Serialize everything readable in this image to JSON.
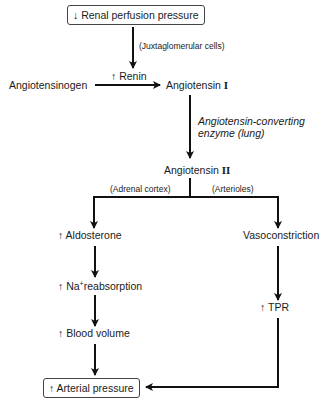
{
  "diagram": {
    "type": "flowchart",
    "nodes": {
      "renal_perfusion": {
        "arrow": "↓",
        "label": "Renal perfusion pressure"
      },
      "juxtaglomerular": {
        "label": "(Juxtaglomerular cells)"
      },
      "renin": {
        "arrow": "↑",
        "label": "Renin"
      },
      "angiotensinogen": {
        "label": "Angiotensinogen"
      },
      "angiotensin_1": {
        "label": "Angiotensin",
        "numeral": "I"
      },
      "ace_line1": {
        "label": "Angiotensin-converting"
      },
      "ace_line2": {
        "label": "enzyme (lung)"
      },
      "angiotensin_2": {
        "label": "Angiotensin",
        "numeral": "II"
      },
      "adrenal_cortex": {
        "label": "(Adrenal cortex)"
      },
      "arterioles": {
        "label": "(Arterioles)"
      },
      "aldosterone": {
        "arrow": "↑",
        "label": "Aldosterone"
      },
      "vasoconstriction": {
        "label": "Vasoconstriction"
      },
      "na_reabsorption": {
        "arrow": "↑",
        "prefix": "Na",
        "sup": "+",
        "label": "reabsorption"
      },
      "tpr": {
        "arrow": "↑",
        "label": "TPR"
      },
      "blood_volume": {
        "arrow": "↑",
        "label": "Blood volume"
      },
      "arterial_pressure": {
        "arrow": "↑",
        "label": "Arterial pressure"
      }
    },
    "edges": [
      [
        "renal_perfusion",
        "angiotensin_1"
      ],
      [
        "angiotensinogen",
        "angiotensin_1"
      ],
      [
        "angiotensin_1",
        "angiotensin_2"
      ],
      [
        "angiotensin_2",
        "aldosterone"
      ],
      [
        "angiotensin_2",
        "vasoconstriction"
      ],
      [
        "aldosterone",
        "na_reabsorption"
      ],
      [
        "na_reabsorption",
        "blood_volume"
      ],
      [
        "blood_volume",
        "arterial_pressure"
      ],
      [
        "vasoconstriction",
        "tpr"
      ],
      [
        "tpr",
        "arterial_pressure"
      ]
    ]
  }
}
